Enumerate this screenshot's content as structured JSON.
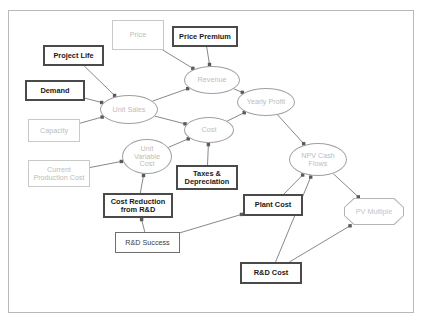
{
  "diagram": {
    "canvas": {
      "width": 424,
      "height": 327,
      "background": "#ffffff"
    },
    "frame": {
      "x": 8,
      "y": 10,
      "width": 406,
      "height": 303,
      "border_color": "#b8b8b8"
    },
    "colors": {
      "bold_border": "#4a4a4a",
      "bold_text": "#1a1a1a",
      "medium_border": "#6e6e6e",
      "medium_text": "#3a3a3a",
      "faint_border": "#c9c9c9",
      "faint_text": "#bdbdbd",
      "ellipse_border": "#a0a0a0",
      "ellipse_text": "#bdbdbd",
      "octagon_border": "#b4b4b4",
      "octagon_text": "#c4c4c4",
      "edge_line": "#7a7a7a"
    },
    "nodes": [
      {
        "id": "price",
        "label": "Price",
        "shape": "rectangle",
        "style": "faint",
        "x": 112,
        "y": 20,
        "w": 52,
        "h": 30
      },
      {
        "id": "price_premium",
        "label": "Price Premium",
        "shape": "rectangle",
        "style": "bold",
        "x": 172,
        "y": 26,
        "w": 66,
        "h": 21
      },
      {
        "id": "project_life",
        "label": "Project Life",
        "shape": "rectangle",
        "style": "bold",
        "x": 43,
        "y": 45,
        "w": 61,
        "h": 21
      },
      {
        "id": "demand",
        "label": "Demand",
        "shape": "rectangle",
        "style": "bold",
        "x": 25,
        "y": 80,
        "w": 60,
        "h": 21
      },
      {
        "id": "capacity",
        "label": "Capacity",
        "shape": "rectangle",
        "style": "faint",
        "x": 28,
        "y": 119,
        "w": 52,
        "h": 23
      },
      {
        "id": "current_prod_cost",
        "label": "Current\nProduction Cost",
        "shape": "rectangle",
        "style": "faint",
        "x": 28,
        "y": 160,
        "w": 62,
        "h": 27
      },
      {
        "id": "unit_sales",
        "label": "Unit Sales",
        "shape": "ellipse",
        "style": "ellipse",
        "x": 100,
        "y": 95,
        "w": 58,
        "h": 29
      },
      {
        "id": "revenue",
        "label": "Revenue",
        "shape": "ellipse",
        "style": "ellipse",
        "x": 184,
        "y": 66,
        "w": 56,
        "h": 28
      },
      {
        "id": "cost",
        "label": "Cost",
        "shape": "ellipse",
        "style": "ellipse",
        "x": 184,
        "y": 117,
        "w": 50,
        "h": 26
      },
      {
        "id": "unit_var_cost",
        "label": "Unit\nVariable\nCost",
        "shape": "ellipse",
        "style": "ellipse",
        "x": 122,
        "y": 139,
        "w": 50,
        "h": 35
      },
      {
        "id": "yearly_profit",
        "label": "Yearly Profit",
        "shape": "ellipse",
        "style": "ellipse",
        "x": 237,
        "y": 88,
        "w": 58,
        "h": 28
      },
      {
        "id": "npv_cash_flows",
        "label": "NPV Cash\nFlows",
        "shape": "ellipse",
        "style": "ellipse",
        "x": 289,
        "y": 143,
        "w": 58,
        "h": 33
      },
      {
        "id": "pv_multiple",
        "label": "PV Multiple",
        "shape": "octagon",
        "style": "octagon",
        "x": 344,
        "y": 198,
        "w": 60,
        "h": 27
      },
      {
        "id": "taxes_dep",
        "label": "Taxes &\nDepreciation",
        "shape": "rectangle",
        "style": "bold",
        "x": 176,
        "y": 165,
        "w": 62,
        "h": 25
      },
      {
        "id": "cost_reduction",
        "label": "Cost Reduction\nfrom R&D",
        "shape": "rectangle",
        "style": "bold",
        "x": 103,
        "y": 193,
        "w": 70,
        "h": 25
      },
      {
        "id": "rd_success",
        "label": "R&D Success",
        "shape": "rectangle",
        "style": "medium",
        "x": 115,
        "y": 232,
        "w": 65,
        "h": 21
      },
      {
        "id": "plant_cost",
        "label": "Plant Cost",
        "shape": "rectangle",
        "style": "bold",
        "x": 243,
        "y": 194,
        "w": 60,
        "h": 22
      },
      {
        "id": "rd_cost",
        "label": "R&D Cost",
        "shape": "rectangle",
        "style": "bold",
        "x": 240,
        "y": 262,
        "w": 62,
        "h": 22
      }
    ],
    "edges": [
      {
        "from": "price",
        "to": "revenue"
      },
      {
        "from": "price_premium",
        "to": "revenue"
      },
      {
        "from": "project_life",
        "to": "unit_sales"
      },
      {
        "from": "demand",
        "to": "unit_sales"
      },
      {
        "from": "capacity",
        "to": "unit_sales"
      },
      {
        "from": "unit_sales",
        "to": "revenue"
      },
      {
        "from": "unit_sales",
        "to": "cost"
      },
      {
        "from": "revenue",
        "to": "yearly_profit"
      },
      {
        "from": "cost",
        "to": "yearly_profit"
      },
      {
        "from": "unit_var_cost",
        "to": "cost"
      },
      {
        "from": "current_prod_cost",
        "to": "unit_var_cost"
      },
      {
        "from": "cost_reduction",
        "to": "unit_var_cost"
      },
      {
        "from": "rd_success",
        "to": "cost_reduction"
      },
      {
        "from": "taxes_dep",
        "to": "cost"
      },
      {
        "from": "yearly_profit",
        "to": "npv_cash_flows"
      },
      {
        "from": "plant_cost",
        "to": "npv_cash_flows"
      },
      {
        "from": "rd_cost",
        "to": "npv_cash_flows"
      },
      {
        "from": "rd_success",
        "to": "plant_cost"
      },
      {
        "from": "npv_cash_flows",
        "to": "pv_multiple"
      },
      {
        "from": "rd_cost",
        "to": "pv_multiple"
      }
    ]
  }
}
